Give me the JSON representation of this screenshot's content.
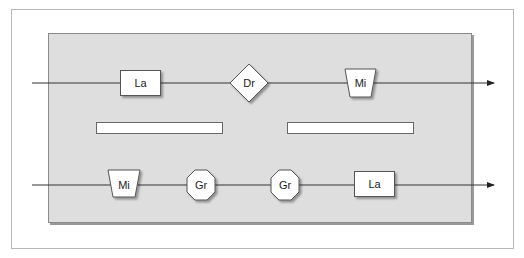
{
  "diagram": {
    "colors": {
      "frame": "#b8b8b8",
      "panel_fill": "#dedede",
      "panel_border": "#8a8a8a",
      "shape_fill": "#ffffff",
      "shape_stroke": "#555555",
      "line": "#333333"
    },
    "top_lane": {
      "nodes": [
        {
          "shape": "rectangle",
          "label": "La"
        },
        {
          "shape": "diamond",
          "label": "Dr"
        },
        {
          "shape": "trapezoid",
          "label": "Mi"
        }
      ]
    },
    "bars": [
      {
        "label": ""
      },
      {
        "label": ""
      }
    ],
    "bottom_lane": {
      "nodes": [
        {
          "shape": "trapezoid",
          "label": "Mi"
        },
        {
          "shape": "octagon",
          "label": "Gr"
        },
        {
          "shape": "octagon",
          "label": "Gr"
        },
        {
          "shape": "rectangle",
          "label": "La"
        }
      ]
    }
  }
}
